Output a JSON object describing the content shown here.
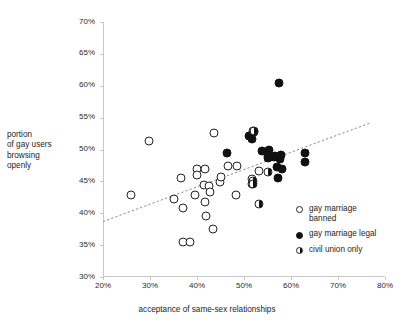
{
  "chart_data": {
    "type": "scatter",
    "title": "",
    "xlabel": "acceptance of same-sex relationships",
    "ylabel_lines": [
      "portion",
      "of gay users",
      "browsing",
      "openly"
    ],
    "ylabel": "portion of gay users browsing openly",
    "xlim": [
      20,
      80
    ],
    "ylim": [
      30,
      70
    ],
    "xticks": [
      20,
      30,
      40,
      50,
      60,
      70,
      80
    ],
    "xtick_labels": [
      "20%",
      "30%",
      "40%",
      "50%",
      "60%",
      "70%",
      "80%"
    ],
    "yticks": [
      30,
      35,
      40,
      45,
      50,
      55,
      60,
      65,
      70
    ],
    "ytick_labels": [
      "30%",
      "35%",
      "40%",
      "45%",
      "50%",
      "55%",
      "60%",
      "65%",
      "70%"
    ],
    "grid": false,
    "legend_position": "bottom-right",
    "legend": [
      {
        "key": "banned",
        "label_lines": [
          "gay marriage",
          "banned"
        ],
        "label": "gay marriage banned",
        "marker": "open-circle"
      },
      {
        "key": "legal",
        "label_lines": [
          "gay marriage legal"
        ],
        "label": "gay marriage legal",
        "marker": "filled-circle"
      },
      {
        "key": "civil",
        "label_lines": [
          "civil union only"
        ],
        "label": "civil union only",
        "marker": "half-filled-circle"
      }
    ],
    "trendline": {
      "style": "dotted",
      "color": "#8a8a8a",
      "x0": 20.0,
      "y0": 38.7,
      "x1": 77.0,
      "y1": 54.2
    },
    "series": [
      {
        "name": "gay marriage banned",
        "key": "banned",
        "marker": "open-circle",
        "points": [
          [
            25.9,
            42.8
          ],
          [
            29.7,
            51.3
          ],
          [
            35.1,
            42.3
          ],
          [
            36.6,
            45.6
          ],
          [
            37.0,
            40.8
          ],
          [
            37.0,
            35.5
          ],
          [
            38.6,
            35.5
          ],
          [
            39.6,
            42.9
          ],
          [
            40.0,
            47.0
          ],
          [
            40.1,
            46.0
          ],
          [
            41.6,
            47.0
          ],
          [
            41.4,
            44.5
          ],
          [
            41.6,
            41.8
          ],
          [
            42.0,
            39.6
          ],
          [
            42.6,
            44.3
          ],
          [
            42.8,
            43.4
          ],
          [
            43.3,
            37.6
          ],
          [
            43.6,
            52.6
          ],
          [
            44.9,
            44.9
          ],
          [
            45.2,
            45.7
          ],
          [
            46.6,
            47.4
          ],
          [
            48.3,
            42.9
          ],
          [
            48.6,
            47.4
          ],
          [
            51.6,
            45.4
          ],
          [
            51.8,
            44.6
          ],
          [
            51.9,
            52.9
          ],
          [
            53.1,
            46.6
          ]
        ]
      },
      {
        "name": "gay marriage legal",
        "key": "legal",
        "marker": "filled-circle",
        "points": [
          [
            46.4,
            49.5
          ],
          [
            51.0,
            52.1
          ],
          [
            51.7,
            51.6
          ],
          [
            52.1,
            52.7
          ],
          [
            53.9,
            49.8
          ],
          [
            55.0,
            49.0
          ],
          [
            55.1,
            48.7
          ],
          [
            55.4,
            50.0
          ],
          [
            55.6,
            48.8
          ],
          [
            56.3,
            48.9
          ],
          [
            56.6,
            49.0
          ],
          [
            57.0,
            47.3
          ],
          [
            57.2,
            45.6
          ],
          [
            57.5,
            60.4
          ],
          [
            57.6,
            48.5
          ],
          [
            57.9,
            49.1
          ],
          [
            58.0,
            47.0
          ],
          [
            62.9,
            49.5
          ],
          [
            63.0,
            48.1
          ]
        ]
      },
      {
        "name": "civil union only",
        "key": "civil",
        "marker": "half-filled-circle",
        "points": [
          [
            52.1,
            52.9
          ],
          [
            51.9,
            45.1
          ],
          [
            52.0,
            44.6
          ],
          [
            53.1,
            41.4
          ],
          [
            55.2,
            46.5
          ]
        ]
      }
    ]
  }
}
